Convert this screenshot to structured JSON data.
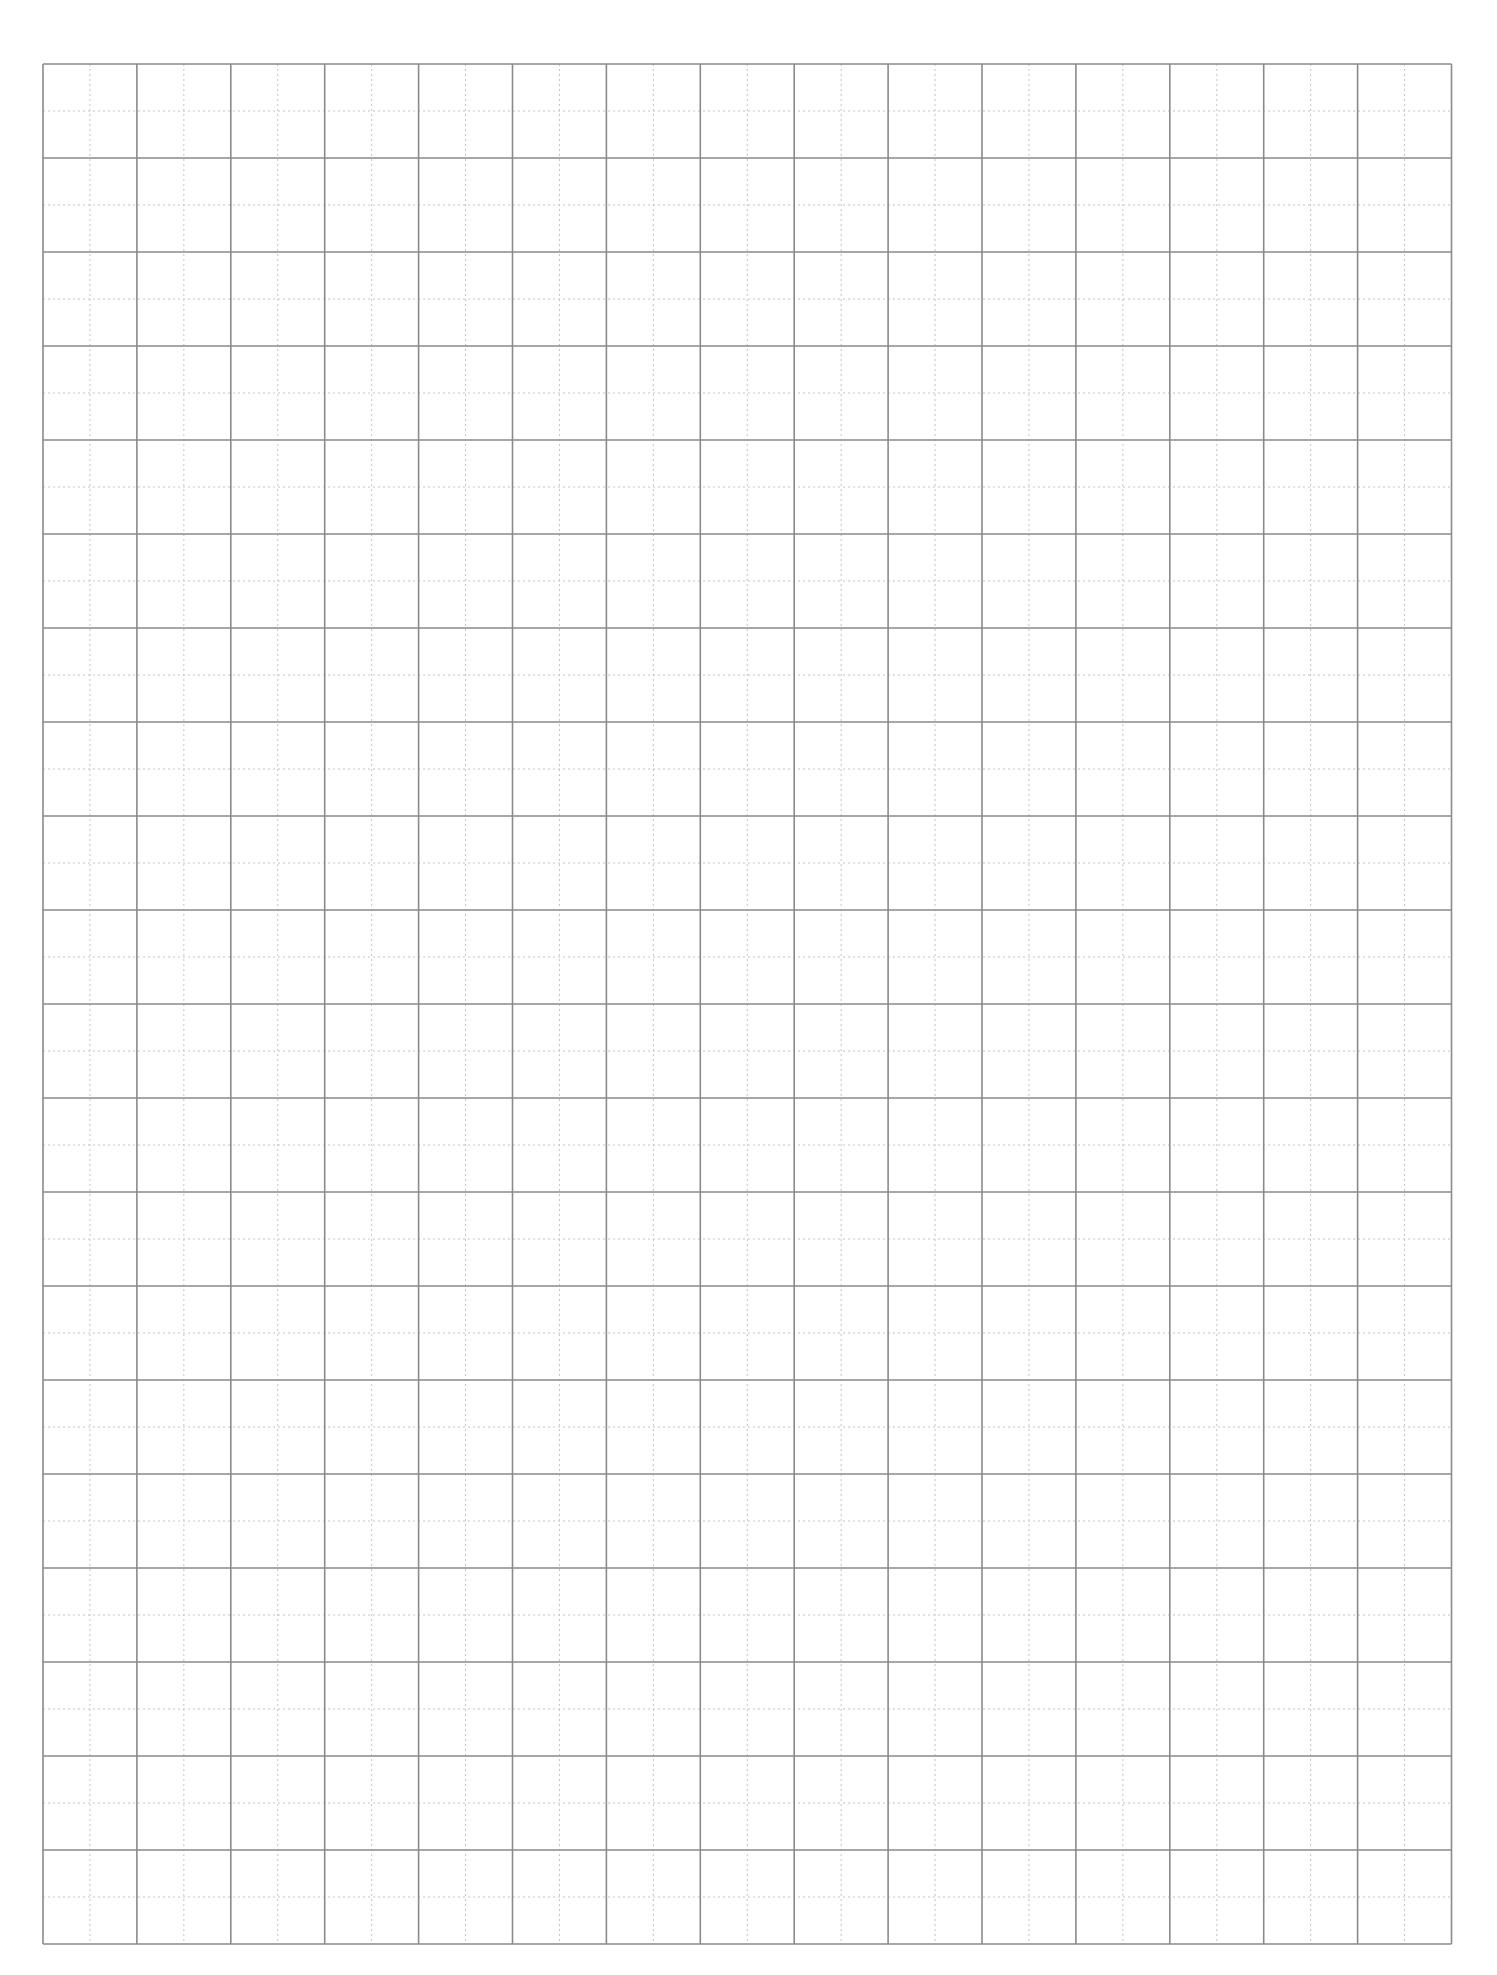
{
  "page": {
    "type": "graph-paper",
    "background_color": "#ffffff"
  },
  "grid": {
    "columns": 15,
    "rows": 20,
    "left": 43,
    "top": 64,
    "cell_width": 93.9,
    "cell_height": 94,
    "major_line_color": "#8a8a8a",
    "major_line_width": 1.6,
    "minor_line_color": "#c4c4c4",
    "minor_line_width": 1,
    "minor_dash": "2,3",
    "subdivisions_per_cell": 2
  }
}
